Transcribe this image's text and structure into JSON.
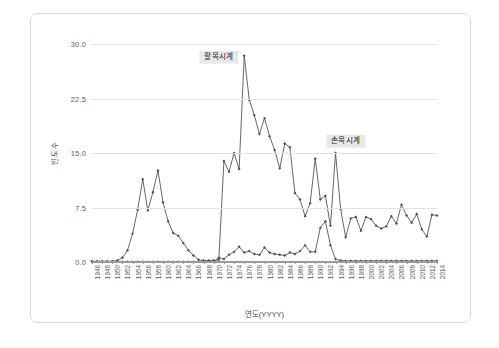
{
  "figure": {
    "background": "#ffffff",
    "border_color": "#d9d9d9"
  },
  "axis": {
    "xlabel": "연도(YYYY)",
    "ylabel": "빈도수",
    "ytick_labels": [
      "0.0",
      "7.5",
      "15.0",
      "22.5",
      "30.0"
    ]
  },
  "annotations": [
    {
      "text": "팔목시계",
      "x_year": 1971,
      "y_value": 28.2
    },
    {
      "text": "손목시계",
      "x_year": 1996,
      "y_value": 16.6
    }
  ],
  "chart_data": {
    "type": "line",
    "title": "",
    "xlabel": "연도(YYYY)",
    "ylabel": "빈도수",
    "xlim": [
      1946,
      2014
    ],
    "ylim": [
      0,
      30
    ],
    "yticks": [
      0.0,
      7.5,
      15.0,
      22.5,
      30.0
    ],
    "grid": true,
    "legend": "none",
    "marker": "diamond",
    "line_color": "#4c4c4c",
    "x": [
      1946,
      1947,
      1948,
      1949,
      1950,
      1951,
      1952,
      1953,
      1954,
      1955,
      1956,
      1957,
      1958,
      1959,
      1960,
      1961,
      1962,
      1963,
      1964,
      1965,
      1966,
      1967,
      1968,
      1969,
      1970,
      1971,
      1972,
      1973,
      1974,
      1975,
      1976,
      1977,
      1978,
      1979,
      1980,
      1981,
      1982,
      1983,
      1984,
      1985,
      1986,
      1987,
      1988,
      1989,
      1990,
      1991,
      1992,
      1993,
      1994,
      1995,
      1996,
      1997,
      1998,
      1999,
      2000,
      2001,
      2002,
      2003,
      2004,
      2005,
      2006,
      2007,
      2008,
      2009,
      2010,
      2011,
      2012,
      2013,
      2014
    ],
    "xtick_labels": [
      "1946",
      "1948",
      "1950",
      "1952",
      "1954",
      "1956",
      "1958",
      "1960",
      "1962",
      "1964",
      "1966",
      "1968",
      "1970",
      "1972",
      "1974",
      "1976",
      "1978",
      "1980",
      "1982",
      "1984",
      "1986",
      "1988",
      "1990",
      "1992",
      "1994",
      "1996",
      "1998",
      "2000",
      "2002",
      "2004",
      "2006",
      "2008",
      "2010",
      "2012",
      "2014"
    ],
    "series": [
      {
        "name": "팔목시계",
        "values": [
          0.1,
          0.1,
          0.1,
          0.1,
          0.1,
          0.2,
          0.6,
          1.6,
          3.9,
          7.2,
          11.4,
          7.1,
          9.6,
          12.6,
          8.2,
          5.6,
          4.0,
          3.6,
          2.6,
          1.6,
          0.9,
          0.3,
          0.2,
          0.2,
          0.2,
          0.3,
          13.9,
          12.4,
          15.0,
          12.8,
          28.4,
          22.3,
          20.2,
          17.6,
          19.8,
          17.3,
          15.4,
          12.9,
          16.3,
          15.8,
          9.5,
          8.6,
          6.3,
          8.1,
          14.2,
          8.6,
          9.1,
          5.0,
          15.0,
          7.3,
          3.4,
          6.0,
          6.2,
          4.3,
          6.2,
          5.9,
          5.0,
          4.6,
          4.9,
          6.3,
          5.3,
          7.9,
          6.4,
          5.4,
          6.6,
          4.5,
          3.5,
          6.5,
          6.4
        ]
      },
      {
        "name": "손목시계",
        "values": [
          0.05,
          0.05,
          0.05,
          0.05,
          0.05,
          0.05,
          0.05,
          0.05,
          0.05,
          0.05,
          0.05,
          0.05,
          0.05,
          0.05,
          0.05,
          0.05,
          0.05,
          0.05,
          0.05,
          0.05,
          0.05,
          0.05,
          0.05,
          0.05,
          0.05,
          0.6,
          0.4,
          1.0,
          1.4,
          2.1,
          1.3,
          1.5,
          1.1,
          1.0,
          2.0,
          1.3,
          1.1,
          1.0,
          0.9,
          1.3,
          1.1,
          1.5,
          2.3,
          1.4,
          1.4,
          4.7,
          5.6,
          2.3,
          0.4,
          0.2,
          0.15,
          0.15,
          0.15,
          0.15,
          0.15,
          0.15,
          0.15,
          0.15,
          0.15,
          0.15,
          0.15,
          0.15,
          0.15,
          0.15,
          0.15,
          0.15,
          0.15,
          0.15,
          0.15
        ]
      }
    ]
  }
}
